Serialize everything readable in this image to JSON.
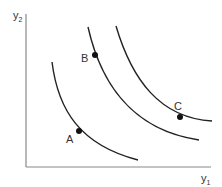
{
  "diagram": {
    "type": "indifference-curves",
    "axes": {
      "x_label": "y",
      "x_sub": "1",
      "y_label": "y",
      "y_sub": "2"
    },
    "curves": [
      {
        "name": "curve-inner",
        "path": "M52,62 C58,110 80,145 138,160"
      },
      {
        "name": "curve-middle",
        "path": "M88,27 C100,80 130,130 199,140"
      },
      {
        "name": "curve-outer",
        "path": "M116,26 C132,80 160,118 212,121"
      }
    ],
    "points": [
      {
        "label": "A",
        "cx": 79,
        "cy": 131,
        "lx": 66,
        "ly": 143
      },
      {
        "label": "B",
        "cx": 95,
        "cy": 55,
        "lx": 81,
        "ly": 62
      },
      {
        "label": "C",
        "cx": 180,
        "cy": 117,
        "lx": 174,
        "ly": 110
      }
    ],
    "colors": {
      "axis": "#888888",
      "curve": "#222222",
      "point": "#111111"
    }
  }
}
